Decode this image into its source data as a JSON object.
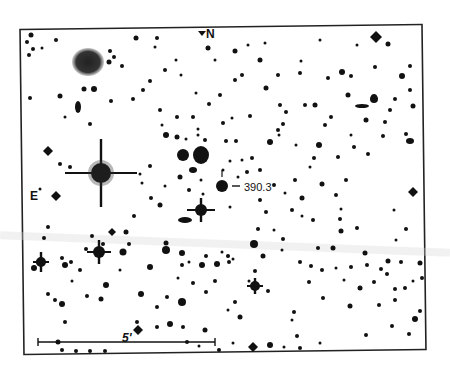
{
  "finder_chart": {
    "labels": {
      "north": "N",
      "east": "E",
      "target": "390.3",
      "scale": "5'"
    },
    "colors": {
      "background": "#ffffff",
      "ink": "#111111",
      "frame": "#222222"
    },
    "frame": {
      "x": 22,
      "y": 27,
      "width": 402,
      "height": 325
    },
    "scale_bar": {
      "x1": 38,
      "x2": 215,
      "y": 342
    },
    "target_star": {
      "x": 222,
      "y": 186,
      "r": 6
    },
    "galaxy_fuzzy": {
      "x": 88,
      "y": 62,
      "rx": 16,
      "ry": 14
    },
    "bright_stars": [
      {
        "x": 101,
        "y": 173,
        "r": 10,
        "spike": 36,
        "vspike": 34
      },
      {
        "x": 201,
        "y": 210,
        "r": 6,
        "spike": 14,
        "vspike": 12
      },
      {
        "x": 99,
        "y": 252,
        "r": 6,
        "spike": 12,
        "vspike": 12
      },
      {
        "x": 41,
        "y": 262,
        "r": 5,
        "spike": 8,
        "vspike": 10
      },
      {
        "x": 255,
        "y": 286,
        "r": 5,
        "spike": 8,
        "vspike": 8
      }
    ],
    "diamond_stars": [
      {
        "x": 376,
        "y": 37,
        "s": 6
      },
      {
        "x": 48,
        "y": 151,
        "s": 5
      },
      {
        "x": 56,
        "y": 196,
        "s": 5
      },
      {
        "x": 413,
        "y": 192,
        "s": 5
      },
      {
        "x": 112,
        "y": 232,
        "s": 4
      },
      {
        "x": 138,
        "y": 330,
        "s": 5
      },
      {
        "x": 253,
        "y": 347,
        "s": 5
      }
    ],
    "blobs": [
      {
        "x": 183,
        "y": 155,
        "rx": 6,
        "ry": 6
      },
      {
        "x": 201,
        "y": 155,
        "rx": 8,
        "ry": 9
      },
      {
        "x": 193,
        "y": 170,
        "rx": 4,
        "ry": 3
      },
      {
        "x": 78,
        "y": 107,
        "rx": 3,
        "ry": 6
      },
      {
        "x": 185,
        "y": 220,
        "rx": 7,
        "ry": 3
      },
      {
        "x": 362,
        "y": 106,
        "rx": 7,
        "ry": 2
      },
      {
        "x": 410,
        "y": 141,
        "rx": 4,
        "ry": 3
      }
    ],
    "stars": [
      [
        31,
        35,
        2.5
      ],
      [
        27,
        42,
        2
      ],
      [
        33,
        49,
        2
      ],
      [
        29,
        55,
        2
      ],
      [
        42,
        48,
        1.5
      ],
      [
        56,
        40,
        2
      ],
      [
        110,
        51,
        2
      ],
      [
        136,
        38,
        2.5
      ],
      [
        157,
        38,
        2
      ],
      [
        30,
        98,
        2
      ],
      [
        60,
        96,
        2.5
      ],
      [
        84,
        89,
        2.5
      ],
      [
        94,
        89,
        3
      ],
      [
        111,
        101,
        2
      ],
      [
        65,
        117,
        1.5
      ],
      [
        90,
        124,
        2
      ],
      [
        160,
        110,
        2
      ],
      [
        162,
        125,
        1.5
      ],
      [
        166,
        135,
        3
      ],
      [
        177,
        137,
        2.5
      ],
      [
        215,
        60,
        1.5
      ],
      [
        208,
        48,
        2.5
      ],
      [
        235,
        51,
        2.5
      ],
      [
        260,
        60,
        2.5
      ],
      [
        300,
        73,
        2
      ],
      [
        301,
        61,
        1.5
      ],
      [
        242,
        75,
        2
      ],
      [
        278,
        75,
        2
      ],
      [
        328,
        78,
        2
      ],
      [
        342,
        72,
        3
      ],
      [
        351,
        76,
        2
      ],
      [
        348,
        95,
        2.5
      ],
      [
        375,
        67,
        2
      ],
      [
        402,
        76,
        3
      ],
      [
        410,
        66,
        2
      ],
      [
        266,
        88,
        2.5
      ],
      [
        235,
        80,
        2
      ],
      [
        280,
        105,
        2
      ],
      [
        286,
        112,
        2
      ],
      [
        283,
        124,
        2
      ],
      [
        250,
        116,
        2
      ],
      [
        278,
        130,
        2
      ],
      [
        279,
        135,
        1.5
      ],
      [
        305,
        105,
        2
      ],
      [
        315,
        105,
        2.5
      ],
      [
        366,
        120,
        2.5
      ],
      [
        374,
        99,
        4
      ],
      [
        374,
        97,
        3
      ],
      [
        406,
        134,
        2
      ],
      [
        319,
        145,
        3
      ],
      [
        354,
        147,
        2
      ],
      [
        368,
        154,
        2
      ],
      [
        322,
        184,
        2.5
      ],
      [
        270,
        142,
        3
      ],
      [
        296,
        145,
        1.5
      ],
      [
        338,
        157,
        2
      ],
      [
        336,
        195,
        2
      ],
      [
        341,
        209,
        1.5
      ],
      [
        236,
        141,
        2
      ],
      [
        252,
        158,
        2
      ],
      [
        242,
        160,
        1.5
      ],
      [
        247,
        172,
        2
      ],
      [
        238,
        177,
        1.5
      ],
      [
        260,
        170,
        2
      ],
      [
        274,
        185,
        2
      ],
      [
        302,
        198,
        2.5
      ],
      [
        230,
        207,
        1.5
      ],
      [
        292,
        210,
        2
      ],
      [
        302,
        216,
        1.5
      ],
      [
        313,
        220,
        2
      ],
      [
        340,
        219,
        2
      ],
      [
        341,
        231,
        2.5
      ],
      [
        333,
        248,
        2.5
      ],
      [
        318,
        248,
        2
      ],
      [
        357,
        228,
        2
      ],
      [
        394,
        210,
        1.5
      ],
      [
        406,
        229,
        2
      ],
      [
        396,
        240,
        1.5
      ],
      [
        420,
        263,
        2.5
      ],
      [
        365,
        253,
        2.5
      ],
      [
        360,
        288,
        2.5
      ],
      [
        388,
        261,
        2.5
      ],
      [
        401,
        262,
        2
      ],
      [
        422,
        278,
        2
      ],
      [
        374,
        282,
        2
      ],
      [
        395,
        289,
        2
      ],
      [
        405,
        288,
        2
      ],
      [
        413,
        281,
        1.5
      ],
      [
        415,
        319,
        3
      ],
      [
        420,
        311,
        2
      ],
      [
        350,
        306,
        2.5
      ],
      [
        366,
        335,
        2
      ],
      [
        297,
        336,
        2
      ],
      [
        270,
        345,
        3
      ],
      [
        292,
        320,
        1.5
      ],
      [
        294,
        312,
        2
      ],
      [
        268,
        291,
        2
      ],
      [
        235,
        302,
        2
      ],
      [
        228,
        310,
        1.5
      ],
      [
        233,
        259,
        1.5
      ],
      [
        254,
        244,
        4
      ],
      [
        263,
        256,
        2.5
      ],
      [
        283,
        239,
        2
      ],
      [
        229,
        262,
        2
      ],
      [
        255,
        271,
        2
      ],
      [
        249,
        281,
        1.5
      ],
      [
        222,
        252,
        1.5
      ],
      [
        228,
        256,
        2
      ],
      [
        215,
        281,
        2
      ],
      [
        240,
        317,
        2.5
      ],
      [
        205,
        330,
        2.5
      ],
      [
        183,
        327,
        2
      ],
      [
        187,
        342,
        2
      ],
      [
        170,
        324,
        3
      ],
      [
        157,
        327,
        2
      ],
      [
        137,
        322,
        2
      ],
      [
        141,
        294,
        3
      ],
      [
        157,
        307,
        2
      ],
      [
        182,
        302,
        4
      ],
      [
        167,
        297,
        2
      ],
      [
        178,
        278,
        1.5
      ],
      [
        193,
        283,
        2
      ],
      [
        206,
        292,
        2
      ],
      [
        150,
        267,
        3
      ],
      [
        166,
        250,
        4
      ],
      [
        166,
        243,
        2.5
      ],
      [
        182,
        253,
        3
      ],
      [
        182,
        265,
        2
      ],
      [
        189,
        262,
        1.5
      ],
      [
        202,
        265,
        3
      ],
      [
        206,
        256,
        2
      ],
      [
        217,
        264,
        3
      ],
      [
        228,
        256,
        1.5
      ],
      [
        134,
        216,
        2
      ],
      [
        126,
        232,
        2.5
      ],
      [
        92,
        236,
        2
      ],
      [
        123,
        252,
        3.5
      ],
      [
        129,
        244,
        2
      ],
      [
        86,
        249,
        2
      ],
      [
        71,
        262,
        2
      ],
      [
        80,
        270,
        2
      ],
      [
        72,
        281,
        1.5
      ],
      [
        62,
        258,
        2
      ],
      [
        65,
        265,
        3
      ],
      [
        87,
        296,
        2
      ],
      [
        106,
        285,
        3
      ],
      [
        101,
        299,
        2.5
      ],
      [
        120,
        270,
        1.5
      ],
      [
        48,
        294,
        2
      ],
      [
        55,
        300,
        2
      ],
      [
        62,
        304,
        3
      ],
      [
        65,
        322,
        2
      ],
      [
        58,
        342,
        2.5
      ],
      [
        62,
        350,
        2
      ],
      [
        76,
        351,
        2
      ],
      [
        90,
        351,
        2
      ],
      [
        105,
        351,
        2
      ],
      [
        103,
        244,
        2
      ],
      [
        48,
        227,
        2
      ],
      [
        44,
        238,
        2
      ],
      [
        39,
        262,
        3
      ],
      [
        34,
        268,
        3
      ],
      [
        60,
        164,
        2
      ],
      [
        70,
        167,
        2
      ],
      [
        40,
        189,
        1.5
      ],
      [
        140,
        174,
        1.5
      ],
      [
        150,
        166,
        2
      ],
      [
        142,
        183,
        1.5
      ],
      [
        151,
        198,
        2
      ],
      [
        160,
        205,
        2.5
      ],
      [
        165,
        186,
        1.5
      ],
      [
        180,
        177,
        2.5
      ],
      [
        189,
        190,
        2
      ],
      [
        201,
        180,
        1.5
      ],
      [
        203,
        194,
        1.5
      ],
      [
        226,
        141,
        2
      ],
      [
        230,
        161,
        1.5
      ],
      [
        223,
        170,
        1.5
      ],
      [
        205,
        140,
        2
      ],
      [
        198,
        135,
        1.5
      ],
      [
        186,
        139,
        1.5
      ],
      [
        177,
        117,
        2
      ],
      [
        193,
        117,
        2
      ],
      [
        209,
        104,
        2
      ],
      [
        223,
        123,
        2
      ],
      [
        232,
        118,
        1.5
      ],
      [
        220,
        95,
        2
      ],
      [
        133,
        99,
        2
      ],
      [
        143,
        90,
        2
      ],
      [
        150,
        81,
        2
      ],
      [
        122,
        66,
        2
      ],
      [
        109,
        62,
        2.5
      ],
      [
        114,
        57,
        2
      ],
      [
        155,
        47,
        1.5
      ],
      [
        165,
        70,
        2
      ],
      [
        176,
        60,
        1.5
      ],
      [
        181,
        75,
        1.5
      ],
      [
        196,
        93,
        1.5
      ],
      [
        198,
        129,
        1.5
      ],
      [
        248,
        45,
        1.5
      ],
      [
        265,
        43,
        1.5
      ],
      [
        320,
        40,
        1.5
      ],
      [
        357,
        45,
        1.5
      ],
      [
        388,
        44,
        2.5
      ],
      [
        395,
        99,
        2
      ],
      [
        390,
        110,
        2
      ],
      [
        385,
        122,
        2
      ],
      [
        383,
        136,
        2
      ],
      [
        413,
        106,
        2.5
      ],
      [
        410,
        90,
        2
      ],
      [
        314,
        158,
        2
      ],
      [
        325,
        125,
        2
      ],
      [
        331,
        117,
        2
      ],
      [
        351,
        135,
        1.5
      ],
      [
        346,
        180,
        2
      ],
      [
        310,
        167,
        1.5
      ],
      [
        295,
        180,
        2
      ],
      [
        285,
        193,
        1.5
      ],
      [
        260,
        200,
        2
      ],
      [
        266,
        212,
        2
      ],
      [
        258,
        229,
        2
      ],
      [
        274,
        230,
        1.5
      ],
      [
        282,
        250,
        1.5
      ],
      [
        300,
        262,
        2
      ],
      [
        311,
        266,
        2
      ],
      [
        322,
        270,
        2
      ],
      [
        309,
        282,
        2
      ],
      [
        323,
        298,
        2
      ],
      [
        336,
        268,
        1.5
      ],
      [
        351,
        267,
        2
      ],
      [
        344,
        280,
        1.5
      ],
      [
        367,
        265,
        2
      ],
      [
        381,
        269,
        2
      ],
      [
        387,
        274,
        2
      ],
      [
        395,
        300,
        2
      ],
      [
        379,
        305,
        2
      ],
      [
        392,
        326,
        2
      ],
      [
        409,
        334,
        2
      ],
      [
        320,
        343,
        1.5
      ],
      [
        300,
        348,
        2
      ],
      [
        284,
        347,
        1.5
      ],
      [
        233,
        343,
        1.5
      ],
      [
        219,
        350,
        2
      ],
      [
        199,
        346,
        1.5
      ]
    ]
  }
}
